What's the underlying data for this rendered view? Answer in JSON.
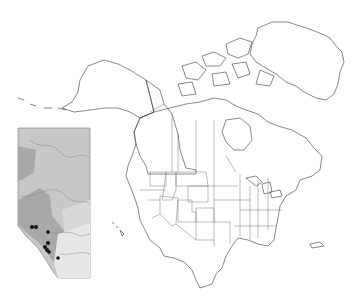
{
  "map": {
    "title": "",
    "region": "North America",
    "colors": {
      "background": "#ffffff",
      "land": "#ffffff",
      "light_range": "#e2e2e2",
      "dark_range": "#7a7a7a",
      "darkest_range": "#5a5a5a",
      "outline": "#555555",
      "inset_bg": "#c8c8c8",
      "inset_dark": "#a8a8a8",
      "inset_light": "#e6e6e6",
      "points": "#111111"
    },
    "light_regions": [
      "Alaska",
      "Yukon",
      "British Columbia",
      "Alberta",
      "Montana",
      "Idaho",
      "Utah",
      "Colorado"
    ],
    "dark_regions": [
      "Washington",
      "Wyoming",
      "Nevada"
    ],
    "inset": {
      "region": "Alberta",
      "point_count": 8
    }
  }
}
